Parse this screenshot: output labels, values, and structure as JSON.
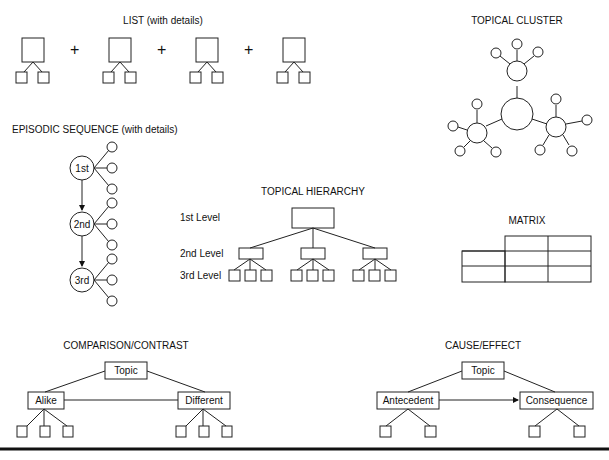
{
  "titles": {
    "list": "LIST (with details)",
    "cluster": "TOPICAL CLUSTER",
    "episodic": "EPISODIC SEQUENCE (with details)",
    "hierarchy": "TOPICAL HIERARCHY",
    "matrix": "MATRIX",
    "comparison": "COMPARISON/CONTRAST",
    "cause": "CAUSE/EFFECT"
  },
  "list": {
    "separator": "+"
  },
  "episodic": {
    "nodes": [
      "1st",
      "2nd",
      "3rd"
    ]
  },
  "hierarchy": {
    "levels": [
      "1st Level",
      "2nd Level",
      "3rd Level"
    ]
  },
  "comparison": {
    "topic": "Topic",
    "left": "Alike",
    "right": "Different"
  },
  "cause": {
    "topic": "Topic",
    "left": "Antecedent",
    "right": "Consequence"
  }
}
